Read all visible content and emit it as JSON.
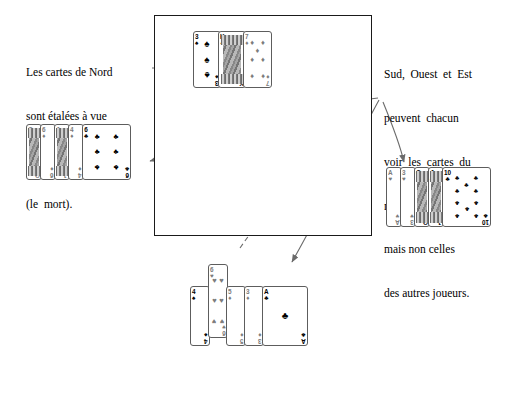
{
  "annotations": {
    "left_caption": {
      "lines": [
        "Les cartes de Nord",
        "sont étalées à vue",
        "sur  la  table",
        "(le  mort)."
      ]
    },
    "right_caption": {
      "lines": [
        "Sud,  Ouest  et  Est",
        "peuvent  chacun",
        "voir  les  cartes  du",
        "mort et les leurs,",
        "mais non celles",
        "des autres joueurs."
      ]
    }
  },
  "table": {
    "label": "bridge-table"
  },
  "hands": {
    "north": {
      "name": "Nord",
      "face_up": true,
      "cards": [
        {
          "rank": "A",
          "suit": "♠",
          "color": "blk",
          "pips": 3,
          "shown_rank": "3",
          "court": false
        },
        {
          "rank": "K",
          "suit": "♠",
          "color": "blk",
          "pips": 0,
          "shown_rank": "K",
          "court": true
        },
        {
          "rank": "7",
          "suit": "♦",
          "color": "red",
          "pips": 7,
          "shown_rank": "7",
          "court": false
        }
      ]
    },
    "west": {
      "name": "Ouest",
      "face_up": false,
      "cards": [
        {
          "rank": "Q",
          "suit": "♦",
          "color": "red",
          "court": true,
          "pips": 0
        },
        {
          "rank": "6",
          "suit": "♦",
          "color": "red",
          "court": false,
          "pips": 0
        },
        {
          "rank": "J",
          "suit": "♦",
          "color": "red",
          "court": true,
          "pips": 0
        },
        {
          "rank": "4",
          "suit": "♦",
          "color": "red",
          "court": false,
          "pips": 0
        },
        {
          "rank": "6",
          "suit": "♣",
          "color": "blk",
          "court": false,
          "pips": 6
        }
      ]
    },
    "east": {
      "name": "Est",
      "face_up": false,
      "cards": [
        {
          "rank": "A",
          "suit": "♥",
          "color": "red",
          "court": false,
          "pips": 0
        },
        {
          "rank": "3",
          "suit": "♥",
          "color": "red",
          "court": false,
          "pips": 0
        },
        {
          "rank": "Q",
          "suit": "♣",
          "color": "blk",
          "court": true,
          "pips": 0
        },
        {
          "rank": "J",
          "suit": "♣",
          "color": "blk",
          "court": true,
          "pips": 0
        },
        {
          "rank": "10",
          "suit": "♣",
          "color": "blk",
          "court": false,
          "pips": 10
        }
      ]
    },
    "south": {
      "name": "Sud",
      "face_up": false,
      "cards": [
        {
          "rank": "4",
          "suit": "♠",
          "color": "blk",
          "court": false,
          "pips": 0
        },
        {
          "rank": "6",
          "suit": "♥",
          "color": "red",
          "court": false,
          "pips": 6
        },
        {
          "rank": "5",
          "suit": "♦",
          "color": "red",
          "court": false,
          "pips": 0
        },
        {
          "rank": "3",
          "suit": "♦",
          "color": "red",
          "court": false,
          "pips": 0
        },
        {
          "rank": "A",
          "suit": "♣",
          "color": "blk",
          "court": false,
          "pips": 1
        }
      ]
    }
  },
  "arrows": [
    {
      "name": "arrow-north-pointer",
      "style": "solid",
      "head": "right"
    },
    {
      "name": "arrow-to-west-hand",
      "style": "curved",
      "head": "left"
    },
    {
      "name": "arrow-to-south-hand",
      "style": "curved",
      "head": "down"
    },
    {
      "name": "arrow-to-east-hand",
      "style": "curved",
      "head": "down"
    },
    {
      "name": "arrow-south-to-table",
      "style": "dashed",
      "head": "up"
    }
  ],
  "colors": {
    "ink": "#000000",
    "frame": "#1a1a1a",
    "card_border": "#5d5d5d",
    "red_suit": "#7c7c7c",
    "black_suit": "#000000",
    "arrow": "#6b6b6b"
  }
}
